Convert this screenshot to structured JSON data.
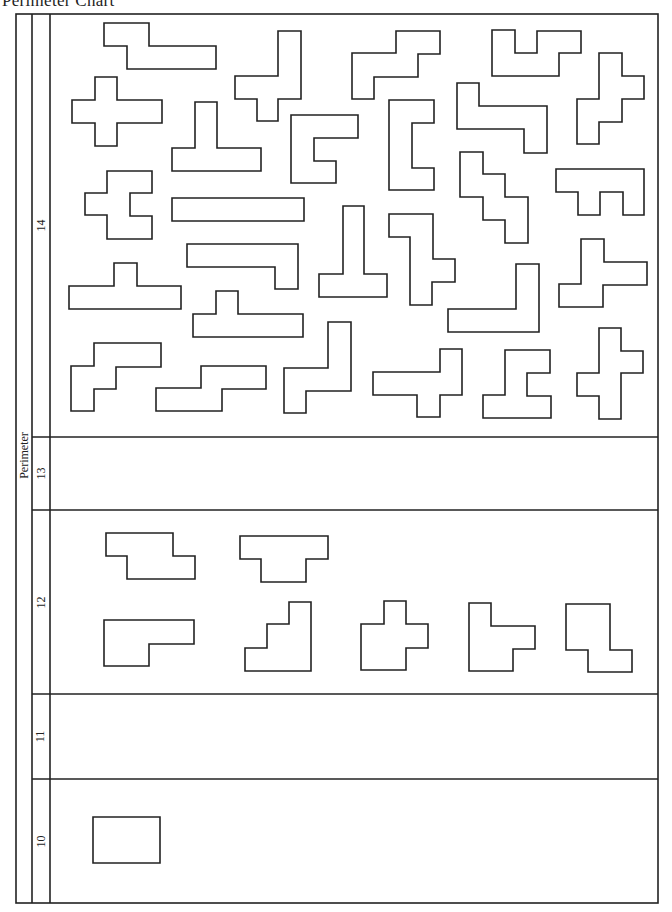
{
  "title": "Perimeter Chart",
  "axis_label": "Perimeter",
  "frame": {
    "left": 16,
    "mid1": 32,
    "mid2": 50,
    "right": 658,
    "top": 14,
    "bottom": 903
  },
  "rows": [
    {
      "perimeter": "14",
      "top": 14,
      "bottom": 437
    },
    {
      "perimeter": "13",
      "top": 437,
      "bottom": 510
    },
    {
      "perimeter": "12",
      "top": 510,
      "bottom": 694
    },
    {
      "perimeter": "11",
      "top": 694,
      "bottom": 779
    },
    {
      "perimeter": "10",
      "top": 779,
      "bottom": 903
    }
  ],
  "shapes": [
    {
      "row": "14",
      "points": "104,23 149,23 149,46 216,46 216,69 127,69 127,46 104,46"
    },
    {
      "row": "14",
      "points": "95,77 117,77 117,100 162,100 162,123 117,123 117,146 95,146 95,123 72,123 72,100 95,100"
    },
    {
      "row": "14",
      "points": "195,102 217,102 217,148 261,148 261,171 172,171 172,148 195,148"
    },
    {
      "row": "14",
      "points": "278,31 301,31 301,99 278,99 278,121 257,121 257,99 235,99 235,76 278,76"
    },
    {
      "row": "14",
      "points": "291,115 358,115 358,138 314,138 314,161 336,161 336,183 291,183"
    },
    {
      "row": "14",
      "points": "396,31 440,31 440,54 418,54 418,77 374,77 374,99 352,99 352,53 396,53"
    },
    {
      "row": "14",
      "points": "492,30 515,30 515,53 537,53 537,31 581,31 581,53 559,53 559,76 492,76"
    },
    {
      "row": "14",
      "points": "599,53 622,53 622,76 644,76 644,99 622,99 622,122 599,122 599,144 577,144 577,99 599,99"
    },
    {
      "row": "14",
      "points": "457,83 479,83 479,106 547,106 547,153 524,153 524,129 457,129"
    },
    {
      "row": "14",
      "points": "389,100 434,100 434,123 412,123 412,168 434,168 434,190 389,190"
    },
    {
      "row": "14",
      "points": "107,171 152,171 152,193 130,193 130,216 152,216 152,239 107,239 107,215 85,215 85,193 107,193"
    },
    {
      "row": "14",
      "points": "172,198 304,198 304,221 172,221"
    },
    {
      "row": "14",
      "points": "187,244 298,244 298,289 275,289 275,267 187,267"
    },
    {
      "row": "14",
      "points": "114,263 137,263 137,286 181,286 181,309 69,309 69,286 114,286"
    },
    {
      "row": "14",
      "points": "216,291 238,291 238,314 303,314 303,337 193,337 193,314 216,314"
    },
    {
      "row": "14",
      "points": "343,206 364,206 364,274 387,274 387,297 319,297 319,274 343,274"
    },
    {
      "row": "14",
      "points": "389,214 433,214 433,259 455,259 455,282 432,282 432,305 410,305 410,237 389,237"
    },
    {
      "row": "14",
      "points": "460,152 483,152 483,174 505,174 505,197 528,197 528,243 505,243 505,220 483,220 483,197 460,197"
    },
    {
      "row": "14",
      "points": "556,169 644,169 644,215 623,215 623,192 600,192 600,215 578,215 578,192 556,192"
    },
    {
      "row": "14",
      "points": "516,264 539,264 539,332 448,332 448,309 516,309"
    },
    {
      "row": "14",
      "points": "581,239 604,239 604,262 647,262 647,285 603,285 603,307 559,307 559,284 581,284"
    },
    {
      "row": "14",
      "points": "94,343 161,343 161,367 116,367 116,389 94,389 94,411 71,411 71,366 94,366"
    },
    {
      "row": "14",
      "points": "201,366 266,366 266,389 222,389 222,411 156,411 156,388 201,388"
    },
    {
      "row": "14",
      "points": "328,322 351,322 351,391 306,391 306,413 284,413 284,368 328,368"
    },
    {
      "row": "14",
      "points": "440,349 462,349 462,395 440,395 440,417 417,417 417,395 373,395 373,372 440,372"
    },
    {
      "row": "14",
      "points": "505,350 550,350 550,373 527,373 527,396 551,396 551,418 483,418 483,395 505,395"
    },
    {
      "row": "14",
      "points": "599,328 621,328 621,351 643,351 643,373 621,373 621,419 599,419 599,396 577,396 577,373 599,373"
    },
    {
      "row": "12",
      "points": "106,533 173,533 173,556 195,556 195,579 127,579 127,556 106,556"
    },
    {
      "row": "12",
      "points": "240,536 328,536 328,559 306,559 306,582 261,582 261,559 240,559"
    },
    {
      "row": "12",
      "points": "104,620 194,620 194,644 149,644 149,666 104,666"
    },
    {
      "row": "12",
      "points": "289,602 311,602 311,671 245,671 245,648 267,648 267,624 289,624"
    },
    {
      "row": "12",
      "points": "384,601 406,601 406,624 428,624 428,648 406,648 406,670 361,670 361,624 384,624"
    },
    {
      "row": "12",
      "points": "469,603 491,603 491,626 535,626 535,649 513,649 513,671 469,671"
    },
    {
      "row": "12",
      "points": "566,604 610,604 610,650 632,650 632,672 588,672 588,650 566,650"
    },
    {
      "row": "10",
      "points": "93,817 160,817 160,863 93,863"
    }
  ]
}
